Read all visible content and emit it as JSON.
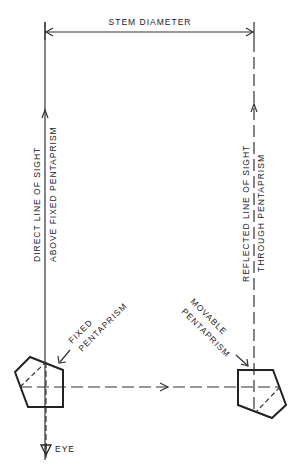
{
  "diagram": {
    "labels": {
      "stem_diameter": "STEM DIAMETER",
      "direct_line_1": "DIRECT LINE OF SIGHT",
      "direct_line_2": "ABOVE FIXED PENTAPRISM",
      "reflected_line_1": "REFLECTED LINE OF SIGHT",
      "reflected_line_2": "THROUGH PENTAPRISM",
      "fixed_1": "FIXED",
      "fixed_2": "PENTAPRISM",
      "movable_1": "MOVABLE",
      "movable_2": "PENTAPRISM",
      "eye": "EYE"
    },
    "components": [
      {
        "name": "fixed pentaprism",
        "position": "bottom-left"
      },
      {
        "name": "movable pentaprism",
        "position": "bottom-right"
      },
      {
        "name": "eye",
        "position": "bottom of direct line"
      }
    ]
  }
}
